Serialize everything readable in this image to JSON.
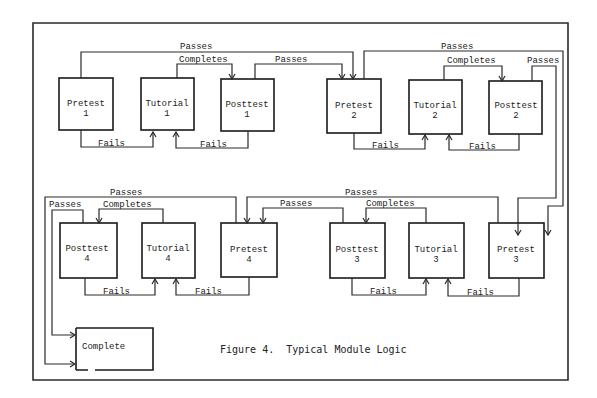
{
  "figure": {
    "caption": "Figure 4.  Typical Module Logic"
  },
  "nodes": {
    "pretest1": {
      "title": "Pretest",
      "num": "1"
    },
    "tutorial1": {
      "title": "Tutorial",
      "num": "1"
    },
    "posttest1": {
      "title": "Posttest",
      "num": "1"
    },
    "pretest2": {
      "title": "Pretest",
      "num": "2"
    },
    "tutorial2": {
      "title": "Tutorial",
      "num": "2"
    },
    "posttest2": {
      "title": "Posttest",
      "num": "2"
    },
    "posttest4": {
      "title": "Posttest",
      "num": "4"
    },
    "tutorial4": {
      "title": "Tutorial",
      "num": "4"
    },
    "pretest4": {
      "title": "Pretest",
      "num": "4"
    },
    "posttest3": {
      "title": "Posttest",
      "num": "3"
    },
    "tutorial3": {
      "title": "Tutorial",
      "num": "3"
    },
    "pretest3": {
      "title": "Pretest",
      "num": "3"
    },
    "complete": {
      "title": "Complete"
    }
  },
  "edges": {
    "passes": "Passes",
    "completes": "Completes",
    "fails": "Fails"
  }
}
